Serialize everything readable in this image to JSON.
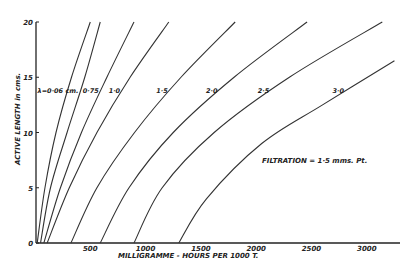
{
  "chart_data": {
    "type": "line",
    "title": "",
    "xlabel": "MILLIGRAMME - HOURS   PER   1000 T.",
    "ylabel": "ACTIVE LENGTH in cms.",
    "xlim": [
      0,
      3300
    ],
    "ylim": [
      0,
      20
    ],
    "x_ticks": [
      "500",
      "1000",
      "1500",
      "2000",
      "2500",
      "3000"
    ],
    "y_ticks": [
      "0",
      "5",
      "10",
      "15",
      "20"
    ],
    "grid": false,
    "annotation": "FILTRATION = 1·5 mms. Pt.",
    "series": [
      {
        "name": "",
        "points": [
          [
            20,
            0
          ],
          [
            90,
            5
          ],
          [
            190,
            10
          ],
          [
            330,
            15
          ],
          [
            500,
            20
          ]
        ]
      },
      {
        "name": "λ=0·06 cm.",
        "points": [
          [
            50,
            0
          ],
          [
            140,
            5
          ],
          [
            290,
            10
          ],
          [
            450,
            15
          ],
          [
            590,
            20
          ]
        ]
      },
      {
        "name": "0·75",
        "points": [
          [
            80,
            0
          ],
          [
            230,
            5
          ],
          [
            420,
            10
          ],
          [
            650,
            15
          ],
          [
            895,
            20
          ]
        ]
      },
      {
        "name": "1·0",
        "points": [
          [
            110,
            0
          ],
          [
            310,
            5
          ],
          [
            560,
            10
          ],
          [
            860,
            15
          ],
          [
            1210,
            20
          ]
        ]
      },
      {
        "name": "1·5",
        "points": [
          [
            325,
            0
          ],
          [
            560,
            5
          ],
          [
            900,
            10
          ],
          [
            1320,
            15
          ],
          [
            1810,
            20
          ]
        ]
      },
      {
        "name": "2·0",
        "points": [
          [
            590,
            0
          ],
          [
            850,
            5
          ],
          [
            1250,
            10
          ],
          [
            1800,
            15
          ],
          [
            2460,
            20
          ]
        ]
      },
      {
        "name": "2·5",
        "points": [
          [
            895,
            0
          ],
          [
            1150,
            5
          ],
          [
            1620,
            10
          ],
          [
            2300,
            15
          ],
          [
            3140,
            20
          ]
        ]
      },
      {
        "name": "3·0",
        "points": [
          [
            1300,
            0
          ],
          [
            1550,
            4
          ],
          [
            2050,
            9
          ],
          [
            2600,
            12.5
          ],
          [
            3250,
            16.5
          ]
        ]
      }
    ]
  }
}
